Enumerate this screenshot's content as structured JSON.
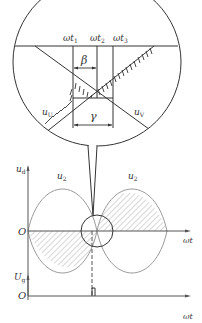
{
  "zoom_view": {
    "labels": {
      "wt1": "ωt",
      "wt1_sub": "1",
      "wt2": "ωt",
      "wt2_sub": "2",
      "wt3": "ωt",
      "wt3_sub": "3",
      "beta": "β",
      "gamma": "γ",
      "uU": "u",
      "uU_sub": "U",
      "uV": "u",
      "uV_sub": "V"
    }
  },
  "main_plot": {
    "y_axis_label": "u",
    "y_axis_sub": "d",
    "origin": "O",
    "x_axis_label": "ωt",
    "curve_left_label": "u",
    "curve_left_sub": "2",
    "curve_right_label": "u",
    "curve_right_sub": "2"
  },
  "pulse_plot": {
    "y_axis_label": "U",
    "y_axis_sub": "g",
    "origin": "O",
    "x_axis_label": "ωt"
  },
  "colors": {
    "line": "#333333",
    "curve": "#9a9a9a",
    "hatch": "#555555"
  }
}
